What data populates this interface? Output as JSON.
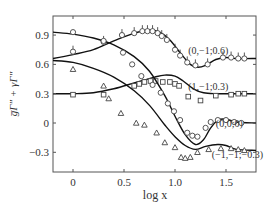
{
  "chart_data": {
    "type": "line",
    "title": "",
    "xlabel": "log x",
    "ylabel": "ḡΓ″ + γΓ″",
    "xlim": [
      -0.2,
      1.8
    ],
    "ylim": [
      -0.5,
      1.09
    ],
    "xticks": [
      0,
      0.5,
      1.0,
      1.5
    ],
    "xtick_labels": [
      "0",
      "0.5",
      "1.0",
      "1.5"
    ],
    "yticks": [
      0.9,
      0.6,
      0.3,
      0,
      -0.3
    ],
    "ytick_labels": [
      "0.9",
      "0.6",
      "0.3",
      "0",
      "−0.3"
    ],
    "grid": false,
    "legend": "inline labels",
    "series": [
      {
        "name": "(0,−1;0.6)",
        "marker": "circle-tick",
        "label_pos": [
          1.13,
          0.75
        ],
        "curve": [
          [
            -0.2,
            0.66
          ],
          [
            0.0,
            0.7
          ],
          [
            0.2,
            0.75
          ],
          [
            0.4,
            0.84
          ],
          [
            0.6,
            0.92
          ],
          [
            0.75,
            0.95
          ],
          [
            0.85,
            0.93
          ],
          [
            0.95,
            0.85
          ],
          [
            1.05,
            0.72
          ],
          [
            1.15,
            0.6
          ],
          [
            1.22,
            0.57
          ],
          [
            1.3,
            0.59
          ],
          [
            1.4,
            0.65
          ],
          [
            1.5,
            0.67
          ],
          [
            1.6,
            0.66
          ],
          [
            1.8,
            0.66
          ]
        ],
        "points": [
          [
            0.0,
            0.73
          ],
          [
            0.3,
            0.83
          ],
          [
            0.48,
            0.9
          ],
          [
            0.6,
            0.92
          ],
          [
            0.68,
            0.94
          ],
          [
            0.73,
            0.94
          ],
          [
            0.78,
            0.94
          ],
          [
            0.83,
            0.92
          ],
          [
            0.87,
            0.89
          ],
          [
            0.92,
            0.85
          ],
          [
            1.0,
            0.75
          ],
          [
            1.05,
            0.69
          ],
          [
            1.12,
            0.62
          ],
          [
            1.2,
            0.59
          ],
          [
            1.32,
            0.6
          ],
          [
            1.47,
            0.67
          ],
          [
            1.55,
            0.67
          ],
          [
            1.62,
            0.66
          ],
          [
            1.68,
            0.66
          ]
        ]
      },
      {
        "name": "(1,−1;0.3)",
        "marker": "square",
        "label_pos": [
          1.13,
          0.38
        ],
        "curve": [
          [
            -0.2,
            0.3
          ],
          [
            0.0,
            0.3
          ],
          [
            0.2,
            0.31
          ],
          [
            0.4,
            0.35
          ],
          [
            0.6,
            0.41
          ],
          [
            0.8,
            0.47
          ],
          [
            0.9,
            0.49
          ],
          [
            1.0,
            0.48
          ],
          [
            1.08,
            0.43
          ],
          [
            1.18,
            0.35
          ],
          [
            1.28,
            0.31
          ],
          [
            1.4,
            0.3
          ],
          [
            1.6,
            0.3
          ],
          [
            1.8,
            0.3
          ]
        ],
        "points": [
          [
            0.0,
            0.29
          ],
          [
            0.3,
            0.29
          ],
          [
            0.6,
            0.38
          ],
          [
            0.65,
            0.4
          ],
          [
            0.7,
            0.42
          ],
          [
            0.76,
            0.43
          ],
          [
            0.81,
            0.43
          ],
          [
            0.88,
            0.42
          ],
          [
            0.95,
            0.42
          ],
          [
            1.0,
            0.4
          ],
          [
            1.04,
            0.38
          ],
          [
            1.13,
            0.27
          ],
          [
            1.25,
            0.23
          ],
          [
            1.4,
            0.28
          ],
          [
            1.55,
            0.29
          ],
          [
            1.62,
            0.3
          ],
          [
            1.68,
            0.3
          ]
        ]
      },
      {
        "name": "(0,0;0)",
        "marker": "circle",
        "label_pos": [
          1.4,
          0.0
        ],
        "curve": [
          [
            -0.2,
            0.93
          ],
          [
            0.0,
            0.91
          ],
          [
            0.2,
            0.87
          ],
          [
            0.4,
            0.8
          ],
          [
            0.6,
            0.68
          ],
          [
            0.75,
            0.53
          ],
          [
            0.9,
            0.28
          ],
          [
            1.0,
            0.07
          ],
          [
            1.1,
            -0.12
          ],
          [
            1.2,
            -0.22
          ],
          [
            1.28,
            -0.17
          ],
          [
            1.35,
            -0.05
          ],
          [
            1.42,
            0.03
          ],
          [
            1.5,
            0.04
          ],
          [
            1.6,
            0.01
          ],
          [
            1.8,
            0.0
          ]
        ],
        "points": [
          [
            0.0,
            0.93
          ],
          [
            0.3,
            0.84
          ],
          [
            0.49,
            0.72
          ],
          [
            0.58,
            0.6
          ],
          [
            0.67,
            0.48
          ],
          [
            0.78,
            0.39
          ],
          [
            0.86,
            0.31
          ],
          [
            0.93,
            0.2
          ],
          [
            0.99,
            0.12
          ],
          [
            1.05,
            0.03
          ],
          [
            1.12,
            -0.1
          ],
          [
            1.17,
            -0.13
          ],
          [
            1.22,
            -0.14
          ],
          [
            1.3,
            -0.05
          ],
          [
            1.35,
            0.01
          ],
          [
            1.42,
            0.03
          ],
          [
            1.5,
            0.03
          ],
          [
            1.58,
            0.01
          ],
          [
            1.65,
            0.0
          ]
        ]
      },
      {
        "name": "(−1,−1;−0.3)",
        "marker": "triangle",
        "label_pos": [
          1.36,
          -0.32
        ],
        "curve": [
          [
            -0.2,
            0.64
          ],
          [
            0.0,
            0.62
          ],
          [
            0.2,
            0.56
          ],
          [
            0.4,
            0.47
          ],
          [
            0.6,
            0.33
          ],
          [
            0.75,
            0.18
          ],
          [
            0.9,
            -0.02
          ],
          [
            1.0,
            -0.14
          ],
          [
            1.1,
            -0.23
          ],
          [
            1.2,
            -0.27
          ],
          [
            1.3,
            -0.24
          ],
          [
            1.42,
            -0.22
          ],
          [
            1.5,
            -0.23
          ],
          [
            1.6,
            -0.27
          ],
          [
            1.8,
            -0.28
          ]
        ],
        "points": [
          [
            0.0,
            0.55
          ],
          [
            0.3,
            0.38
          ],
          [
            0.35,
            0.25
          ],
          [
            0.47,
            0.1
          ],
          [
            0.62,
            -0.0
          ],
          [
            0.7,
            -0.02
          ],
          [
            0.82,
            -0.1
          ],
          [
            0.9,
            -0.2
          ],
          [
            1.0,
            -0.25
          ],
          [
            1.06,
            -0.35
          ],
          [
            1.1,
            -0.36
          ],
          [
            1.15,
            -0.35
          ],
          [
            1.22,
            -0.3
          ],
          [
            1.33,
            -0.27
          ],
          [
            1.45,
            -0.26
          ],
          [
            1.55,
            -0.26
          ],
          [
            1.62,
            -0.27
          ],
          [
            1.68,
            -0.28
          ]
        ]
      }
    ]
  }
}
